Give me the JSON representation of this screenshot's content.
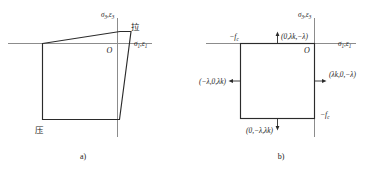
{
  "figure": {
    "title_a": "a)",
    "title_b": "b)",
    "panels": [
      {
        "id": "panel-a",
        "caption": "a)",
        "description": "biaxial failure envelope quadrilateral",
        "axes": {
          "horizontal_label_sigma": "σ",
          "horizontal_label_sigma_sub": "1",
          "horizontal_label_eps": "ε",
          "horizontal_label_eps_sub": "1",
          "vertical_label_sigma": "σ",
          "vertical_label_sigma_sub": "3",
          "vertical_label_eps": "ε",
          "vertical_label_eps_sub": "3",
          "origin": "O"
        },
        "region_labels": {
          "tension": "拉",
          "compression": "压"
        }
      },
      {
        "id": "panel-b",
        "caption": "b)",
        "description": "square yield surface with outward normal vectors",
        "axes": {
          "horizontal_label_sigma": "σ",
          "horizontal_label_sigma_sub": "1",
          "horizontal_label_eps": "ε",
          "horizontal_label_eps_sub": "1",
          "vertical_label_sigma": "σ",
          "vertical_label_sigma_sub": "3",
          "vertical_label_eps": "ε",
          "vertical_label_eps_sub": "3",
          "origin": "O"
        },
        "strength_labels": {
          "top_left": "−f",
          "top_left_sub": "c",
          "bottom_right": "−f",
          "bottom_right_sub": "c"
        },
        "normal_vectors": [
          {
            "name": "top-normal",
            "label": "(0,λk,−λ)"
          },
          {
            "name": "left-normal",
            "label": "(−λ,0,λk)"
          },
          {
            "name": "right-normal",
            "label": "(λk,0,−λ)"
          },
          {
            "name": "bottom-normal",
            "label": "(0,−λ,λk)"
          }
        ]
      }
    ]
  },
  "colors": {
    "axis": "#8c8c8c",
    "curve": "#2b2b2b",
    "text": "#1a1a1a",
    "background": "#ffffff"
  }
}
